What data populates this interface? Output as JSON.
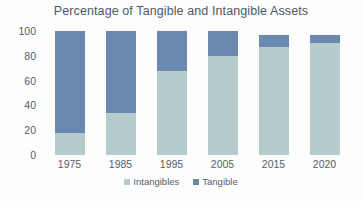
{
  "chart_data": {
    "type": "bar",
    "title": "Percentage of Tangible and Intangible Assets",
    "xlabel": "",
    "ylabel": "",
    "ylim": [
      0,
      100
    ],
    "yticks": [
      0,
      20,
      40,
      60,
      80,
      100
    ],
    "ytick_labels": [
      "0",
      "20",
      "40",
      "60",
      "80",
      "100"
    ],
    "grid": false,
    "stacked": true,
    "legend_position": "bottom",
    "categories": [
      "1975",
      "1985",
      "1995",
      "2005",
      "2015",
      "2020"
    ],
    "series": [
      {
        "name": "Intangibles",
        "color": "#b6cbcc",
        "values": [
          18,
          34,
          68,
          80,
          87,
          90
        ]
      },
      {
        "name": "Tangible",
        "color": "#6b88b0",
        "values": [
          82,
          66,
          32,
          20,
          10,
          7
        ]
      }
    ],
    "totals": [
      100,
      100,
      100,
      100,
      97,
      97
    ]
  },
  "legend": {
    "items": [
      {
        "label": "Intangibles",
        "color": "#b6cbcc"
      },
      {
        "label": "Tangible",
        "color": "#6b88b0"
      }
    ]
  }
}
